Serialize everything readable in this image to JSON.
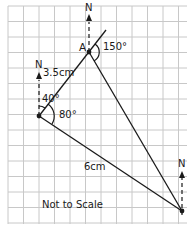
{
  "diagram": {
    "type": "bearings-triangle",
    "scale_note": "Not to Scale",
    "colors": {
      "background": "#ffffff",
      "grid": "#c8c8c8",
      "lines": "#1a1a1a"
    },
    "points": {
      "A": {
        "label": "A",
        "x": 89,
        "y": 52
      },
      "O": {
        "label": "",
        "x": 39,
        "y": 116
      },
      "B": {
        "label": "",
        "x": 182,
        "y": 211
      }
    },
    "north_labels": {
      "A": "N",
      "O": "N",
      "B": "N"
    },
    "segments": [
      {
        "from": "O",
        "to": "A",
        "length_label": "3.5cm"
      },
      {
        "from": "O",
        "to": "B",
        "length_label": "6cm"
      },
      {
        "from": "A",
        "to": "B",
        "length_label": ""
      }
    ],
    "angles": [
      {
        "at": "O",
        "label": "40°",
        "description": "bearing from north to OA"
      },
      {
        "at": "O",
        "label": "80°",
        "description": "angle between OA and OB"
      },
      {
        "at": "A",
        "label": "150°",
        "description": "angle at A"
      }
    ]
  }
}
